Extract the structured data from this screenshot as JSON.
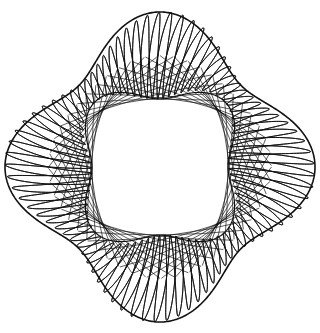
{
  "figure": {
    "description": "Four-lobed spirograph-style string-art pattern with crosshatched mesh bands and an open center",
    "background_color": "#ffffff",
    "stroke_color": "#111111",
    "canvas": {
      "width": 320,
      "height": 333
    },
    "center": {
      "x": 160,
      "y": 167
    },
    "lobes": 4,
    "lobe_directions": [
      "top",
      "right",
      "bottom",
      "left"
    ],
    "outer_envelope": {
      "base": 135,
      "amplitude": 20
    },
    "inner_envelope": {
      "base": 80,
      "amplitude": -12
    },
    "mesh": {
      "oscillation_frequency": 40.5,
      "turns": 2,
      "samples_per_turn": 2400,
      "stroke_width": 0.9,
      "stroke_opacity": 0.95
    },
    "chords": {
      "count": 48,
      "stroke_width": 0.8,
      "stroke_opacity": 0.85
    },
    "twist_degrees": 3
  }
}
